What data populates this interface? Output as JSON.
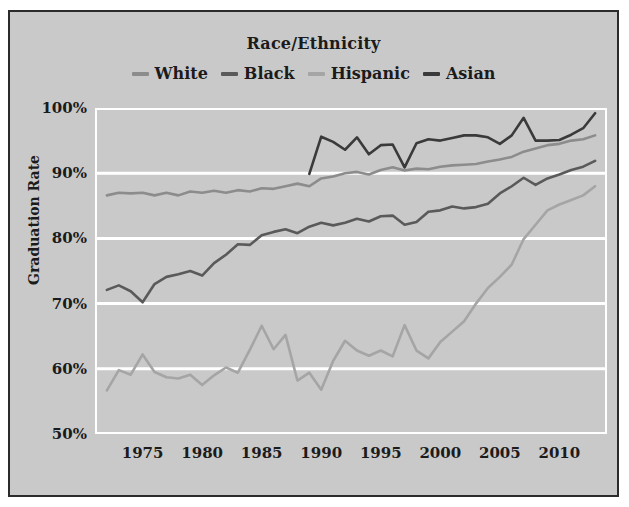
{
  "figure": {
    "background_color": "#c9c9c9",
    "border_color": "#2b2b2b"
  },
  "chart_data": {
    "type": "line",
    "title": "Race/Ethnicity",
    "xlabel": "",
    "ylabel": "Graduation Rate",
    "xlim": [
      1971,
      2014
    ],
    "ylim": [
      50,
      100
    ],
    "grid": true,
    "grid_color": "#ffffff",
    "legend_position": "top-center",
    "y_ticks": [
      50,
      60,
      70,
      80,
      90,
      100
    ],
    "y_tick_labels": [
      "50%",
      "60%",
      "70%",
      "80%",
      "90%",
      "100%"
    ],
    "x_ticks": [
      1975,
      1980,
      1985,
      1990,
      1995,
      2000,
      2005,
      2010
    ],
    "x_tick_labels": [
      "1975",
      "1980",
      "1985",
      "1990",
      "1995",
      "2000",
      "2005",
      "2010"
    ],
    "series": [
      {
        "name": "White",
        "color": "#8c8c8c",
        "x": [
          1972,
          1973,
          1974,
          1975,
          1976,
          1977,
          1978,
          1979,
          1980,
          1981,
          1982,
          1983,
          1984,
          1985,
          1986,
          1987,
          1988,
          1989,
          1990,
          1991,
          1992,
          1993,
          1994,
          1995,
          1996,
          1997,
          1998,
          1999,
          2000,
          2001,
          2002,
          2003,
          2004,
          2005,
          2006,
          2007,
          2008,
          2009,
          2010,
          2011,
          2012,
          2013
        ],
        "values": [
          86.6,
          87.0,
          86.9,
          87.0,
          86.6,
          87.0,
          86.6,
          87.2,
          87.0,
          87.3,
          87.0,
          87.4,
          87.2,
          87.7,
          87.6,
          88.0,
          88.4,
          88.0,
          89.2,
          89.5,
          90.0,
          90.2,
          89.8,
          90.5,
          90.9,
          90.4,
          90.7,
          90.6,
          91.0,
          91.2,
          91.3,
          91.4,
          91.8,
          92.1,
          92.5,
          93.3,
          93.8,
          94.3,
          94.5,
          95.0,
          95.2,
          95.8
        ]
      },
      {
        "name": "Black",
        "color": "#5a5a5a",
        "x": [
          1972,
          1973,
          1974,
          1975,
          1976,
          1977,
          1978,
          1979,
          1980,
          1981,
          1982,
          1983,
          1984,
          1985,
          1986,
          1987,
          1988,
          1989,
          1990,
          1991,
          1992,
          1993,
          1994,
          1995,
          1996,
          1997,
          1998,
          1999,
          2000,
          2001,
          2002,
          2003,
          2004,
          2005,
          2006,
          2007,
          2008,
          2009,
          2010,
          2011,
          2012,
          2013
        ],
        "values": [
          72.1,
          72.8,
          71.9,
          70.2,
          73.0,
          74.1,
          74.5,
          75.0,
          74.3,
          76.2,
          77.5,
          79.1,
          79.0,
          80.5,
          81.0,
          81.4,
          80.8,
          81.8,
          82.4,
          82.0,
          82.4,
          83.0,
          82.6,
          83.4,
          83.5,
          82.1,
          82.5,
          84.1,
          84.3,
          84.9,
          84.6,
          84.8,
          85.3,
          86.9,
          88.0,
          89.3,
          88.2,
          89.2,
          89.8,
          90.5,
          91.0,
          91.9
        ]
      },
      {
        "name": "Hispanic",
        "color": "#a5a5a5",
        "x": [
          1972,
          1973,
          1974,
          1975,
          1976,
          1977,
          1978,
          1979,
          1980,
          1981,
          1982,
          1983,
          1984,
          1985,
          1986,
          1987,
          1988,
          1989,
          1990,
          1991,
          1992,
          1993,
          1994,
          1995,
          1996,
          1997,
          1998,
          1999,
          2000,
          2001,
          2002,
          2003,
          2004,
          2005,
          2006,
          2007,
          2008,
          2009,
          2010,
          2011,
          2012,
          2013
        ],
        "values": [
          56.7,
          59.8,
          59.1,
          62.2,
          59.5,
          58.7,
          58.5,
          59.1,
          57.5,
          59.0,
          60.2,
          59.4,
          62.9,
          66.6,
          63.0,
          65.2,
          58.2,
          59.4,
          56.8,
          61.2,
          64.3,
          62.8,
          62.0,
          62.8,
          61.9,
          66.7,
          62.8,
          61.6,
          64.1,
          65.7,
          67.3,
          70.0,
          72.4,
          74.1,
          76.0,
          79.9,
          82.1,
          84.3,
          85.2,
          85.9,
          86.6,
          88.0
        ]
      },
      {
        "name": "Asian",
        "color": "#3a3a3a",
        "x": [
          1989,
          1990,
          1991,
          1992,
          1993,
          1994,
          1995,
          1996,
          1997,
          1998,
          1999,
          2000,
          2001,
          2002,
          2003,
          2004,
          2005,
          2006,
          2007,
          2008,
          2009,
          2010,
          2011,
          2012,
          2013
        ],
        "values": [
          89.9,
          95.6,
          94.8,
          93.6,
          95.5,
          92.9,
          94.3,
          94.4,
          90.9,
          94.6,
          95.2,
          95.0,
          95.4,
          95.8,
          95.8,
          95.5,
          94.5,
          95.8,
          98.5,
          95.0,
          95.0,
          95.1,
          95.9,
          96.9,
          99.2
        ]
      }
    ]
  }
}
